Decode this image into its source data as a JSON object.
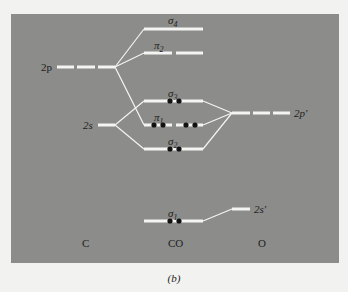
{
  "diagram": {
    "type": "molecular-orbital-energy-diagram",
    "molecule": "CO",
    "columns": {
      "left": "C",
      "center": "CO",
      "right": "O"
    },
    "atomic_levels": {
      "carbon": [
        {
          "label": "2p",
          "degeneracy": 3
        },
        {
          "label": "2s",
          "degeneracy": 1
        }
      ],
      "oxygen": [
        {
          "label": "2p'",
          "degeneracy": 3
        },
        {
          "label": "2s'",
          "degeneracy": 1
        }
      ]
    },
    "molecular_orbitals": [
      {
        "label": "σ4",
        "sym": "σ",
        "sub": "4",
        "electrons": 0,
        "degeneracy": 1
      },
      {
        "label": "π2",
        "sym": "π",
        "sub": "2",
        "electrons": 0,
        "degeneracy": 2
      },
      {
        "label": "σ3",
        "sym": "σ",
        "sub": "3",
        "electrons": 2,
        "degeneracy": 1
      },
      {
        "label": "π1",
        "sym": "π",
        "sub": "1",
        "electrons": 4,
        "degeneracy": 2
      },
      {
        "label": "σ2",
        "sym": "σ",
        "sub": "2",
        "electrons": 2,
        "degeneracy": 1
      },
      {
        "label": "σ1",
        "sym": "σ",
        "sub": "1",
        "electrons": 2,
        "degeneracy": 1
      }
    ],
    "caption": "(b)",
    "colors": {
      "panel": "#8c8c8a",
      "level_line": "#f4f4f2",
      "electron": "#111111",
      "text": "#1e1e1e"
    }
  }
}
